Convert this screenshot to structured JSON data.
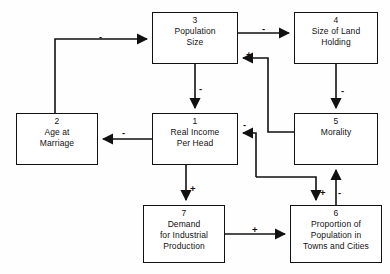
{
  "diagram": {
    "type": "causal-loop-diagram",
    "background_color": "#ffffff",
    "line_color": "#111111",
    "nodes": [
      {
        "id": "1",
        "number": "1",
        "label": "Real Income\nPer Head",
        "x": 152,
        "y": 113,
        "w": 86,
        "h": 52
      },
      {
        "id": "2",
        "number": "2",
        "label": "Age at\nMarriage",
        "x": 16,
        "y": 113,
        "w": 82,
        "h": 52
      },
      {
        "id": "3",
        "number": "3",
        "label": "Population\nSize",
        "x": 152,
        "y": 12,
        "w": 86,
        "h": 52
      },
      {
        "id": "4",
        "number": "4",
        "label": "Size of Land\nHolding",
        "x": 294,
        "y": 12,
        "w": 84,
        "h": 52
      },
      {
        "id": "5",
        "number": "5",
        "label": "Morality",
        "x": 294,
        "y": 113,
        "w": 84,
        "h": 52
      },
      {
        "id": "6",
        "number": "6",
        "label": "Proportion of\nPopulation in\nTowns and Cities",
        "x": 290,
        "y": 205,
        "w": 92,
        "h": 58
      },
      {
        "id": "7",
        "number": "7",
        "label": "Demand\nfor Industrial\nProduction",
        "x": 143,
        "y": 205,
        "w": 82,
        "h": 58
      }
    ],
    "edges": [
      {
        "id": "e-2-3",
        "from": "2",
        "to": "3",
        "sign": "-",
        "sign_x": 99,
        "sign_y": 32,
        "description": "Age at Marriage reduces Population Size"
      },
      {
        "id": "e-3-4",
        "from": "3",
        "to": "4",
        "sign": "-",
        "sign_x": 262,
        "sign_y": 30,
        "description": "Population Size reduces Size of Land Holding"
      },
      {
        "id": "e-5-3",
        "from": "5",
        "to": "3",
        "sign": "+",
        "sign_x": 243,
        "sign_y": 52,
        "description": "Morality increases Population Size"
      },
      {
        "id": "e-3-1",
        "from": "3",
        "to": "1",
        "sign": "-",
        "sign_x": 199,
        "sign_y": 84,
        "description": "Population Size reduces Real Income Per Head"
      },
      {
        "id": "e-4-5",
        "from": "4",
        "to": "5",
        "sign": "-",
        "sign_x": 342,
        "sign_y": 85,
        "description": "Size of Land Holding reduces Morality"
      },
      {
        "id": "e-1-2",
        "from": "1",
        "to": "2",
        "sign": "-",
        "sign_x": 122,
        "sign_y": 126,
        "description": "Real Income Per Head reduces Age at Marriage"
      },
      {
        "id": "e-6-1",
        "from": "6",
        "to": "1",
        "sign": "-",
        "sign_x": 241,
        "sign_y": 121,
        "description": "Proportion of Population in Towns and Cities reduces Real Income Per Head"
      },
      {
        "id": "e-1-7",
        "from": "1",
        "to": "7",
        "sign": "+",
        "sign_x": 200,
        "sign_y": 186,
        "description": "Real Income Per Head increases Demand for Industrial Production"
      },
      {
        "id": "e-7-6",
        "from": "7",
        "to": "6",
        "sign": "+",
        "sign_x": 257,
        "sign_y": 228,
        "description": "Demand for Industrial Production increases Proportion of Population in Towns and Cities"
      },
      {
        "id": "e-in-6",
        "from": "1",
        "to": "6",
        "sign": "+",
        "sign_x": 323,
        "sign_y": 188,
        "description": "Downward arrow into Proportion of Population in Towns and Cities"
      },
      {
        "id": "e-6-5",
        "from": "6",
        "to": "5",
        "sign": "-",
        "sign_x": 340,
        "sign_y": 188,
        "description": "Proportion of Population in Towns and Cities reduces Morality"
      }
    ]
  }
}
